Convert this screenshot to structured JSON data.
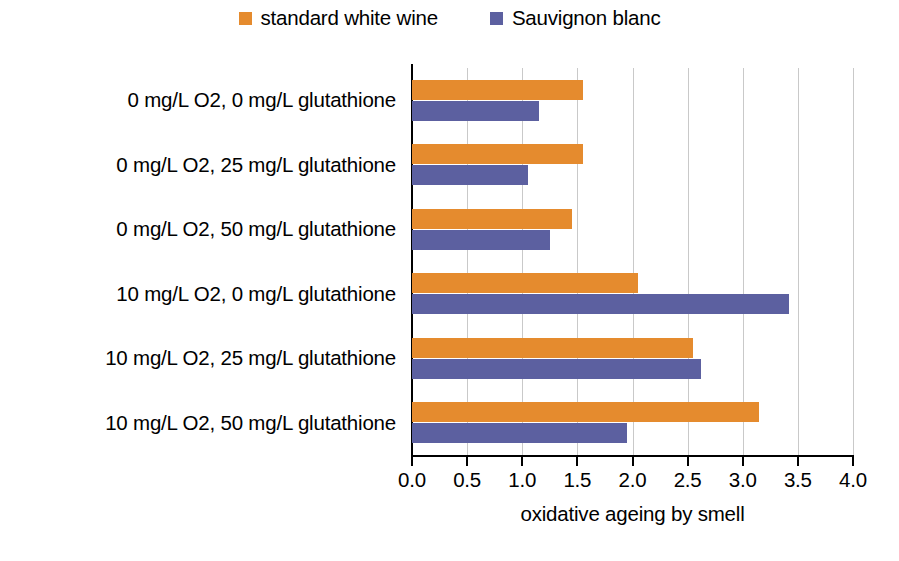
{
  "chart_data": {
    "type": "bar",
    "orientation": "horizontal",
    "title": "",
    "xlabel": "oxidative ageing by smell",
    "ylabel": "",
    "xlim": [
      0.0,
      4.0
    ],
    "xticks": [
      "0.0",
      "0.5",
      "1.0",
      "1.5",
      "2.0",
      "2.5",
      "3.0",
      "3.5",
      "4.0"
    ],
    "xtick_values": [
      0.0,
      0.5,
      1.0,
      1.5,
      2.0,
      2.5,
      3.0,
      3.5,
      4.0
    ],
    "grid": "vertical",
    "legend_position": "top-center",
    "categories": [
      "0 mg/L O2,  0 mg/L glutathione",
      "0 mg/L O2,  25 mg/L glutathione",
      "0 mg/L O2,  50 mg/L glutathione",
      "10 mg/L O2,  0 mg/L glutathione",
      "10 mg/L O2,  25 mg/L glutathione",
      "10 mg/L O2,  50 mg/L glutathione"
    ],
    "series": [
      {
        "name": "standard white wine",
        "color": "#E58B2E",
        "values": [
          1.55,
          1.55,
          1.45,
          2.05,
          2.55,
          3.15
        ]
      },
      {
        "name": "Sauvignon blanc",
        "color": "#5C60A0",
        "values": [
          1.15,
          1.05,
          1.25,
          3.42,
          2.62,
          1.95
        ]
      }
    ]
  },
  "legend": {
    "items": [
      {
        "label": "standard white wine",
        "color": "#E58B2E"
      },
      {
        "label": "Sauvignon blanc",
        "color": "#5C60A0"
      }
    ]
  }
}
